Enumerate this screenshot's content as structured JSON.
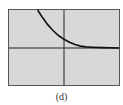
{
  "caption": "(d)",
  "colors": {
    "background": "#d8d8d8",
    "frame": "#555555",
    "axes": "#222222",
    "curve": "#111111"
  },
  "chart_data": {
    "type": "line",
    "title": "",
    "xlabel": "",
    "ylabel": "",
    "grid": false,
    "legend": null,
    "xlim": [
      -1,
      1
    ],
    "ylim": [
      -1,
      1
    ],
    "series": [
      {
        "name": "curve",
        "x": [
          -0.48,
          -0.4,
          -0.3,
          -0.2,
          -0.1,
          0.0,
          0.1,
          0.2,
          0.3,
          0.4,
          0.5,
          0.7,
          1.0
        ],
        "y": [
          1.0,
          0.82,
          0.62,
          0.46,
          0.33,
          0.23,
          0.15,
          0.09,
          0.05,
          0.03,
          0.02,
          0.01,
          0.0
        ]
      }
    ]
  }
}
